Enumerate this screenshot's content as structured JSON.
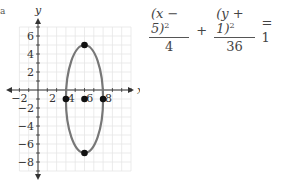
{
  "corner_label": "a",
  "equation": {
    "term1_num": "(x − 5)",
    "term1_exp": "2",
    "term1_den": "4",
    "plus": "+",
    "term2_num": "(y + 1)",
    "term2_exp": "2",
    "term2_den": "36",
    "equals": "= 1"
  },
  "chart_data": {
    "type": "scatter",
    "title": "",
    "xlabel": "x",
    "ylabel": "y",
    "xlim": [
      -2,
      10
    ],
    "ylim": [
      -9,
      7
    ],
    "grid": true,
    "x_tick_labels": [
      "−2",
      "2",
      "4",
      "6",
      "8"
    ],
    "y_tick_labels": [
      "6",
      "4",
      "2",
      "−2",
      "−4",
      "−6",
      "−8"
    ],
    "curve": {
      "type": "ellipse",
      "center": [
        5,
        -1
      ],
      "a": 2,
      "b": 6,
      "color": "#777777"
    },
    "points": [
      {
        "x": 5,
        "y": 5,
        "label": "vertex"
      },
      {
        "x": 5,
        "y": -7,
        "label": "vertex"
      },
      {
        "x": 3,
        "y": -1,
        "label": "co-vertex"
      },
      {
        "x": 7,
        "y": -1,
        "label": "co-vertex"
      },
      {
        "x": 5,
        "y": -1,
        "label": "center"
      }
    ],
    "colors": {
      "grid": "#e6e6e6",
      "axis": "#333333",
      "curve": "#777777",
      "point": "#111111"
    }
  }
}
